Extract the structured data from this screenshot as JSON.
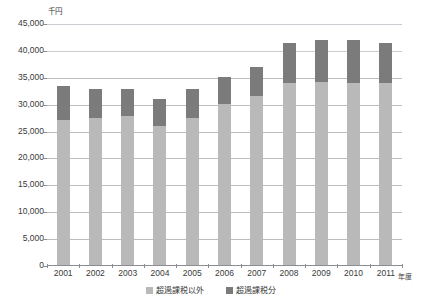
{
  "chart_data": {
    "type": "bar",
    "stacked": true,
    "title": "",
    "xlabel": "年度",
    "ylabel": "千円",
    "unit_label": "千円",
    "categories": [
      "2001",
      "2002",
      "2003",
      "2004",
      "2005",
      "2006",
      "2007",
      "2008",
      "2009",
      "2010",
      "2011"
    ],
    "series": [
      {
        "name": "超過課税以外",
        "color": "#b9b9b9",
        "values": [
          27000,
          27300,
          27800,
          25800,
          27300,
          30000,
          31500,
          33900,
          34000,
          33900,
          33900
        ]
      },
      {
        "name": "超過課税分",
        "color": "#7b7b7b",
        "values": [
          6200,
          5400,
          4900,
          5000,
          5400,
          5000,
          5300,
          7300,
          7800,
          8000,
          7400
        ]
      }
    ],
    "totals": [
      33200,
      32700,
      32700,
      30800,
      32700,
      35000,
      36800,
      41200,
      41800,
      41900,
      41300
    ],
    "ylim": [
      0,
      45000
    ],
    "ytick_values": [
      0,
      5000,
      10000,
      15000,
      20000,
      25000,
      30000,
      35000,
      40000,
      45000
    ],
    "ytick_labels": [
      "0",
      "5,000",
      "10,000",
      "15,000",
      "20,000",
      "25,000",
      "30,000",
      "35,000",
      "40,000",
      "45,000"
    ],
    "grid": true,
    "legend_position": "bottom"
  },
  "legend": {
    "items": [
      {
        "label": "超過課税以外",
        "color": "#b9b9b9"
      },
      {
        "label": "超過課税分",
        "color": "#7b7b7b"
      }
    ]
  }
}
